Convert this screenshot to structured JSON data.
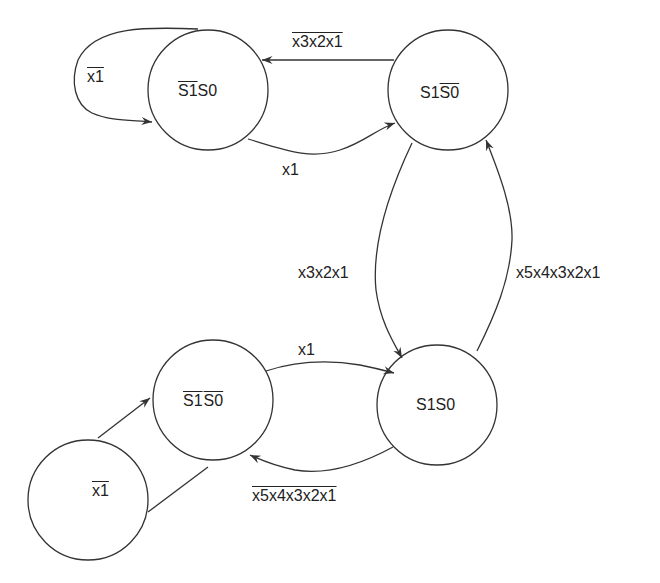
{
  "diagram": {
    "type": "state-transition",
    "states": [
      {
        "id": "A",
        "label": "S1S0",
        "overbars": "S1",
        "display_text": "S1S0",
        "center": [
          208,
          90
        ]
      },
      {
        "id": "B",
        "label": "S1S0",
        "overbars": "S0",
        "display_text": "S1S0",
        "center": [
          448,
          90
        ]
      },
      {
        "id": "C",
        "label": "S1S0",
        "overbars": "S1,S0",
        "display_text": "S1S0",
        "center": [
          213,
          400
        ]
      },
      {
        "id": "D",
        "label": "S1S0",
        "overbars": "none",
        "display_text": "S1S0",
        "center": [
          437,
          405
        ]
      }
    ],
    "transitions": [
      {
        "from": "A",
        "to": "A",
        "label": "x1",
        "negated": true
      },
      {
        "from": "A",
        "to": "B",
        "label": "x1",
        "negated": false
      },
      {
        "from": "B",
        "to": "A",
        "label": "x3x2x1",
        "negated": true
      },
      {
        "from": "B",
        "to": "D",
        "label": "x3x2x1",
        "negated": false
      },
      {
        "from": "D",
        "to": "B",
        "label": "x5x4x3x2x1",
        "negated": false
      },
      {
        "from": "C",
        "to": "D",
        "label": "x1",
        "negated": false
      },
      {
        "from": "D",
        "to": "C",
        "label": "x5x4x3x2x1",
        "negated": true
      },
      {
        "from": "C",
        "to": "C",
        "label": "x1",
        "negated": true
      }
    ]
  },
  "labels": {
    "state_a": "S1S0",
    "state_b": "S1S0",
    "state_c": "S1S0",
    "state_d": "S1S0",
    "a_self": "x1",
    "a_to_b": "x1",
    "b_to_a": "x3x2x1",
    "b_to_d": "x3x2x1",
    "d_to_b": "x5x4x3x2x1",
    "c_to_d": "x1",
    "d_to_c": "x5x4x3x2x1",
    "c_self": "x1"
  },
  "colors": {
    "stroke": "#333333",
    "text": "#222222",
    "background": "#ffffff"
  }
}
